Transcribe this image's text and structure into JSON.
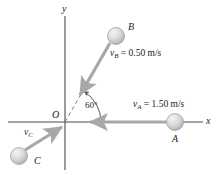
{
  "figure": {
    "type": "physics-vector-diagram",
    "background_color": "#ffffff",
    "axes": {
      "x_label": "x",
      "y_label": "y",
      "origin_label": "O",
      "axis_color": "#4a4a4a"
    },
    "angle": {
      "value": "60",
      "unit": "°",
      "text": "60°",
      "measured_from": "x-axis",
      "measured_to": "dashed-line-of-vB"
    },
    "bodies": [
      {
        "id": "A",
        "label": "A",
        "ball_color": "#d9d9d9",
        "velocity": {
          "symbol": "v",
          "subscript": "A",
          "equals": "=",
          "magnitude": "1.50",
          "units": "m/s",
          "text": "v_A = 1.50 m/s",
          "direction": "negative-x"
        }
      },
      {
        "id": "B",
        "label": "B",
        "ball_color": "#d9d9d9",
        "velocity": {
          "symbol": "v",
          "subscript": "B",
          "equals": "=",
          "magnitude": "0.50",
          "units": "m/s",
          "text": "v_B = 0.50 m/s",
          "direction": "toward-origin-at-60-deg"
        }
      },
      {
        "id": "C",
        "label": "C",
        "ball_color": "#d9d9d9",
        "velocity": {
          "symbol": "v",
          "subscript": "C",
          "equals": "",
          "magnitude": "",
          "units": "",
          "text": "v_C",
          "direction": "toward-origin-up-right"
        }
      }
    ],
    "vector_color": "#a8a8a8",
    "dashed_line_color": "#7a7a7a"
  }
}
